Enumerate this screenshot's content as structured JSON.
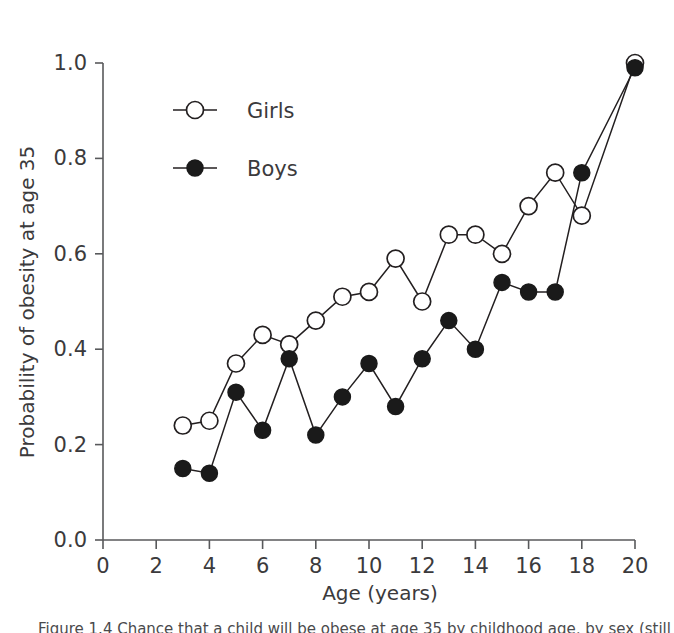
{
  "figure": {
    "background": "#ffffff",
    "line_color": "#231f20",
    "axis_color": "#58595b",
    "text_color": "#3b3a3c"
  },
  "caption": {
    "text": "Figure 1.4 Chance that a child will be obese at age 35 by childhood age, by sex (still legible)"
  },
  "chart_data": {
    "type": "line",
    "title": "",
    "subtitle": "",
    "xlabel": "Age (years)",
    "ylabel": "Probability of obesity at age 35",
    "xlim": [
      0,
      20
    ],
    "ylim": [
      0.0,
      1.0
    ],
    "xticks": [
      0,
      2,
      4,
      6,
      8,
      10,
      12,
      14,
      16,
      18,
      20
    ],
    "xticklabels": [
      "0",
      "2",
      "4",
      "6",
      "8",
      "10",
      "12",
      "14",
      "16",
      "18",
      "20"
    ],
    "yticks": [
      0.0,
      0.2,
      0.4,
      0.6,
      0.8,
      1.0
    ],
    "yticklabels": [
      "0.0",
      "0.2",
      "0.4",
      "0.6",
      "0.8",
      "1.0"
    ],
    "grid": false,
    "legend_position": "upper-left-inside",
    "x": [
      3,
      4,
      5,
      6,
      7,
      8,
      9,
      10,
      11,
      12,
      13,
      14,
      15,
      16,
      17,
      18,
      19,
      20
    ],
    "series": [
      {
        "name": "Girls",
        "marker": "open-circle",
        "color": "#231f20",
        "x": [
          3,
          4,
          5,
          6,
          7,
          8,
          9,
          10,
          11,
          12,
          13,
          14,
          15,
          16,
          17,
          18,
          20
        ],
        "values": [
          0.24,
          0.25,
          0.37,
          0.43,
          0.41,
          0.46,
          0.51,
          0.52,
          0.59,
          0.5,
          0.64,
          0.64,
          0.6,
          0.7,
          0.77,
          0.68,
          1.0
        ]
      },
      {
        "name": "Boys",
        "marker": "filled-circle",
        "color": "#1a1a1a",
        "x": [
          3,
          4,
          5,
          6,
          7,
          8,
          9,
          10,
          11,
          12,
          13,
          14,
          15,
          16,
          17,
          18,
          20
        ],
        "values": [
          0.15,
          0.14,
          0.31,
          0.23,
          0.38,
          0.22,
          0.3,
          0.37,
          0.28,
          0.38,
          0.46,
          0.4,
          0.54,
          0.52,
          0.52,
          0.77,
          0.99
        ]
      }
    ],
    "legend": [
      {
        "label": "Girls",
        "marker": "open-circle"
      },
      {
        "label": "Boys",
        "marker": "filled-circle"
      }
    ]
  }
}
